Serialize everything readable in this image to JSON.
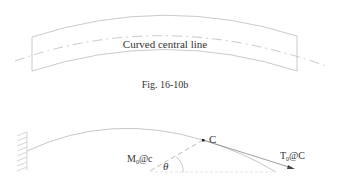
{
  "figure_top": {
    "label": "Curved central line",
    "caption": "Fig. 16-10b"
  },
  "figure_bottom": {
    "point_label": "C",
    "moment_label_main": "M",
    "moment_label_sub": "0",
    "moment_label_suffix": "@c",
    "tangent_label_main": "T",
    "tangent_label_sub": "0",
    "tangent_label_suffix": "@C",
    "angle_label": "θ"
  },
  "colors": {
    "line": "#b8b8b8",
    "text": "#333333"
  }
}
